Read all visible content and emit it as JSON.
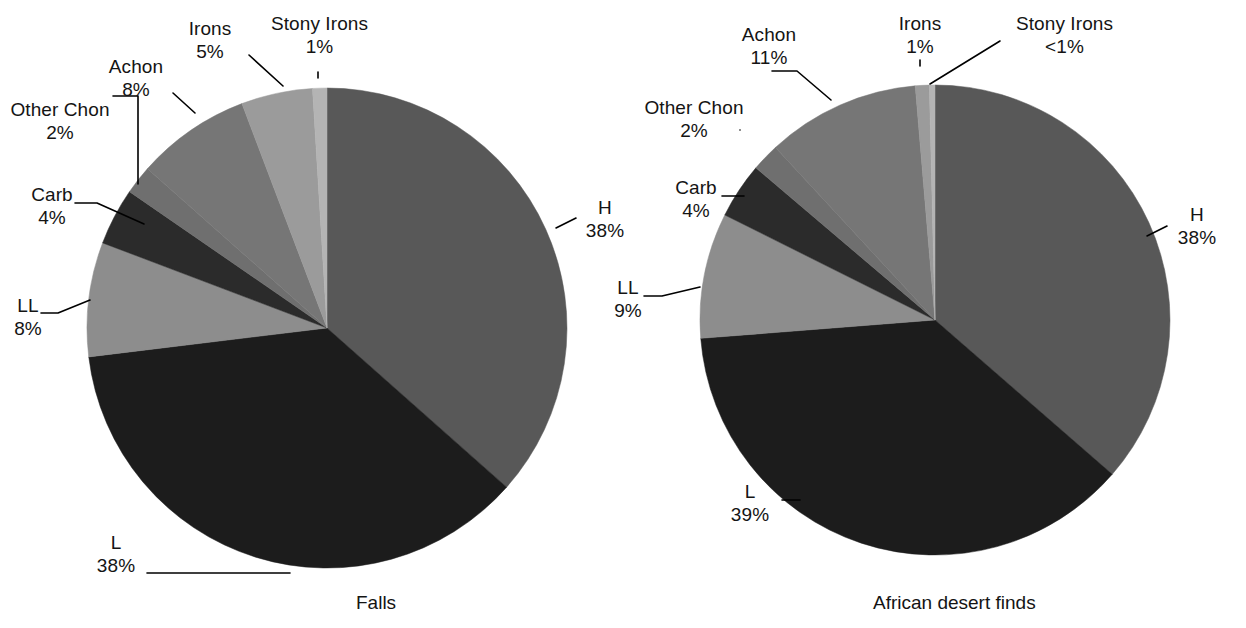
{
  "figure": {
    "background": "#ffffff",
    "text_color": "#141414",
    "leader_color": "#000000"
  },
  "chart_data": [
    {
      "type": "pie",
      "title": "Falls",
      "id": "falls",
      "center": [
        327,
        328
      ],
      "radius": 240,
      "start_angle_deg": 0,
      "direction": "clockwise",
      "labels": [
        "H",
        "L",
        "LL",
        "Carb",
        "Other Chon",
        "Achon",
        "Irons",
        "Stony Irons"
      ],
      "values": [
        38,
        38,
        8,
        4,
        2,
        8,
        5,
        1
      ],
      "value_texts": [
        "38%",
        "38%",
        "8%",
        "4%",
        "2%",
        "8%",
        "5%",
        "1%"
      ],
      "colors": [
        "#585858",
        "#1c1c1c",
        "#8d8d8d",
        "#2b2b2b",
        "#6f6f6f",
        "#767676",
        "#9b9b9b",
        "#b4b4b4"
      ],
      "legend": "none",
      "grid": false
    },
    {
      "type": "pie",
      "title": "African desert finds",
      "id": "african-desert-finds",
      "center": [
        935,
        320
      ],
      "radius": 235,
      "start_angle_deg": 0,
      "direction": "clockwise",
      "labels": [
        "H",
        "L",
        "LL",
        "Carb",
        "Other Chon",
        "Achon",
        "Irons",
        "Stony Irons"
      ],
      "values": [
        38,
        39,
        9,
        4,
        2,
        11,
        1,
        0.4
      ],
      "value_texts": [
        "38%",
        "39%",
        "9%",
        "4%",
        "2%",
        "11%",
        "1%",
        "<1%"
      ],
      "colors": [
        "#585858",
        "#1c1c1c",
        "#8d8d8d",
        "#2b2b2b",
        "#6f6f6f",
        "#767676",
        "#9b9b9b",
        "#b4b4b4"
      ],
      "legend": "none",
      "grid": false
    }
  ],
  "left_chart": {
    "caption": "Falls",
    "labels": {
      "stony_irons": {
        "name": "Stony Irons",
        "pct": "1%"
      },
      "irons": {
        "name": "Irons",
        "pct": "5%"
      },
      "achon": {
        "name": "Achon",
        "pct": "8%"
      },
      "other_chon": {
        "name": "Other Chon",
        "pct": "2%"
      },
      "carb": {
        "name": "Carb",
        "pct": "4%"
      },
      "ll": {
        "name": "LL",
        "pct": "8%"
      },
      "l": {
        "name": "L",
        "pct": "38%"
      },
      "h": {
        "name": "H",
        "pct": "38%"
      }
    }
  },
  "right_chart": {
    "caption": "African desert finds",
    "labels": {
      "stony_irons": {
        "name": "Stony Irons",
        "pct": "<1%"
      },
      "irons": {
        "name": "Irons",
        "pct": "1%"
      },
      "achon": {
        "name": "Achon",
        "pct": "11%"
      },
      "other_chon": {
        "name": "Other Chon",
        "pct": "2%"
      },
      "carb": {
        "name": "Carb",
        "pct": "4%"
      },
      "ll": {
        "name": "LL",
        "pct": "9%"
      },
      "l": {
        "name": "L",
        "pct": "39%"
      },
      "h": {
        "name": "H",
        "pct": "38%"
      }
    }
  }
}
